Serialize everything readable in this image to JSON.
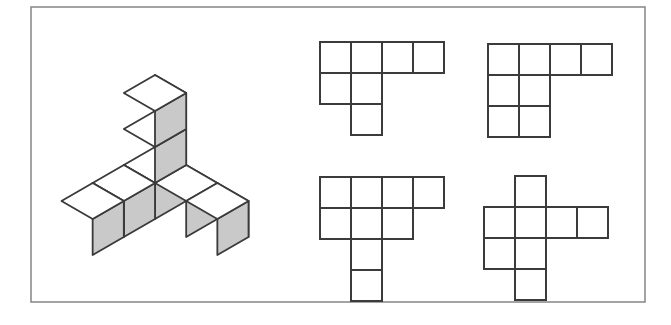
{
  "figure": {
    "canvas": {
      "width": 671,
      "height": 325
    },
    "background_color": "#ffffff",
    "frame": {
      "name": "figure-border",
      "x": 31,
      "y": 7,
      "width": 614,
      "height": 295,
      "stroke_color": "#8c8c8c",
      "stroke_width": 1.6,
      "fill": "#ffffff"
    },
    "colors": {
      "cube_top_face": "#ffffff",
      "cube_left_face": "#c9c9c9",
      "cube_right_face": "#c9c9c9",
      "cube_edge": "#3a3a3a",
      "net_cell_fill": "#ffffff",
      "net_line": "#3b3b3b"
    }
  },
  "solid": {
    "name": "isometric-cube-solid",
    "description": "Tripod arrangement of unit cubes drawn in isometric projection",
    "origin": {
      "x": 155,
      "y": 183
    },
    "cube_size": 36,
    "cube_count": 7,
    "edge_width": 1.8,
    "cells": [
      {
        "label": "center",
        "x": 0,
        "y": 0,
        "z": 0
      },
      {
        "label": "up-1",
        "x": 0,
        "y": 0,
        "z": 1
      },
      {
        "label": "up-2",
        "x": 0,
        "y": 0,
        "z": 2
      },
      {
        "label": "right-1",
        "x": 1,
        "y": 0,
        "z": 0
      },
      {
        "label": "right-2",
        "x": 2,
        "y": 0,
        "z": 0
      },
      {
        "label": "back-1",
        "x": 0,
        "y": 1,
        "z": 0
      },
      {
        "label": "back-2",
        "x": 0,
        "y": 2,
        "z": 0
      }
    ]
  },
  "nets": [
    {
      "id": "net-top-left",
      "name": "net-option-top-left",
      "origin": {
        "x": 320,
        "y": 42
      },
      "cell": 31,
      "cells": [
        {
          "col": 0,
          "row": 0
        },
        {
          "col": 1,
          "row": 0
        },
        {
          "col": 2,
          "row": 0
        },
        {
          "col": 3,
          "row": 0
        },
        {
          "col": 0,
          "row": 1
        },
        {
          "col": 1,
          "row": 1
        },
        {
          "col": 1,
          "row": 2
        }
      ],
      "cell_count": 7
    },
    {
      "id": "net-top-right",
      "name": "net-option-top-right",
      "origin": {
        "x": 488,
        "y": 44
      },
      "cell": 31,
      "cells": [
        {
          "col": 0,
          "row": 0
        },
        {
          "col": 1,
          "row": 0
        },
        {
          "col": 2,
          "row": 0
        },
        {
          "col": 3,
          "row": 0
        },
        {
          "col": 0,
          "row": 1
        },
        {
          "col": 1,
          "row": 1
        },
        {
          "col": 0,
          "row": 2
        },
        {
          "col": 1,
          "row": 2
        }
      ],
      "cell_count": 8
    },
    {
      "id": "net-bottom-left",
      "name": "net-option-bottom-left",
      "origin": {
        "x": 320,
        "y": 177
      },
      "cell": 31,
      "cells": [
        {
          "col": 0,
          "row": 0
        },
        {
          "col": 1,
          "row": 0
        },
        {
          "col": 2,
          "row": 0
        },
        {
          "col": 3,
          "row": 0
        },
        {
          "col": 0,
          "row": 1
        },
        {
          "col": 1,
          "row": 1
        },
        {
          "col": 2,
          "row": 1
        },
        {
          "col": 1,
          "row": 2
        },
        {
          "col": 1,
          "row": 3
        }
      ],
      "cell_count": 9
    },
    {
      "id": "net-bottom-right",
      "name": "net-option-bottom-right",
      "origin": {
        "x": 484,
        "y": 176
      },
      "cell": 31,
      "cells": [
        {
          "col": 1,
          "row": 0
        },
        {
          "col": 0,
          "row": 1
        },
        {
          "col": 1,
          "row": 1
        },
        {
          "col": 2,
          "row": 1
        },
        {
          "col": 3,
          "row": 1
        },
        {
          "col": 0,
          "row": 2
        },
        {
          "col": 1,
          "row": 2
        },
        {
          "col": 1,
          "row": 3
        }
      ],
      "cell_count": 8
    }
  ]
}
